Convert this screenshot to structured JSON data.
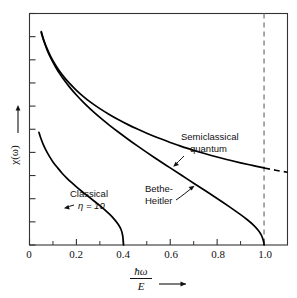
{
  "chart_data": {
    "type": "line",
    "title": "",
    "xlabel": "ħω / E",
    "xlabel_numerator": "ħω",
    "xlabel_denominator": "E",
    "ylabel": "χ(ω)",
    "xlim": [
      0,
      1.1
    ],
    "ylim": [
      0,
      1
    ],
    "grid": false,
    "legend": "annotations-inline",
    "xticks": [
      0,
      0.2,
      0.4,
      0.6,
      0.8,
      1.0
    ],
    "xticklabels": [
      "0",
      "0.2",
      "0.4",
      "0.6",
      "0.8",
      "1.0"
    ],
    "xminorticks": [
      0.1,
      0.3,
      0.5,
      0.7,
      0.9,
      1.1
    ],
    "yticks": [
      0.0,
      0.1,
      0.2,
      0.3,
      0.4,
      0.5,
      0.6,
      0.7,
      0.8,
      0.9,
      1.0
    ],
    "yticklabels": [],
    "series": [
      {
        "name": "Semiclassical quantum",
        "style": "solid-then-dashed",
        "dash_begins_x": 1.0,
        "points": [
          [
            0.05,
            0.922
          ],
          [
            0.06,
            0.888
          ],
          [
            0.075,
            0.848
          ],
          [
            0.09,
            0.815
          ],
          [
            0.11,
            0.779
          ],
          [
            0.13,
            0.748
          ],
          [
            0.15,
            0.722
          ],
          [
            0.17,
            0.699
          ],
          [
            0.2,
            0.668
          ],
          [
            0.23,
            0.641
          ],
          [
            0.26,
            0.617
          ],
          [
            0.3,
            0.589
          ],
          [
            0.34,
            0.564
          ],
          [
            0.38,
            0.541
          ],
          [
            0.42,
            0.52
          ],
          [
            0.46,
            0.501
          ],
          [
            0.5,
            0.483
          ],
          [
            0.55,
            0.462
          ],
          [
            0.6,
            0.443
          ],
          [
            0.65,
            0.425
          ],
          [
            0.7,
            0.409
          ],
          [
            0.75,
            0.394
          ],
          [
            0.8,
            0.38
          ],
          [
            0.85,
            0.367
          ],
          [
            0.9,
            0.355
          ],
          [
            0.95,
            0.344
          ],
          [
            1.0,
            0.333
          ],
          [
            1.05,
            0.323
          ],
          [
            1.1,
            0.314
          ]
        ]
      },
      {
        "name": "Bethe-Heitler",
        "style": "solid",
        "points": [
          [
            0.05,
            0.918
          ],
          [
            0.06,
            0.884
          ],
          [
            0.075,
            0.843
          ],
          [
            0.09,
            0.809
          ],
          [
            0.11,
            0.771
          ],
          [
            0.13,
            0.738
          ],
          [
            0.15,
            0.709
          ],
          [
            0.17,
            0.683
          ],
          [
            0.2,
            0.648
          ],
          [
            0.23,
            0.616
          ],
          [
            0.26,
            0.587
          ],
          [
            0.3,
            0.551
          ],
          [
            0.34,
            0.518
          ],
          [
            0.38,
            0.487
          ],
          [
            0.42,
            0.457
          ],
          [
            0.46,
            0.428
          ],
          [
            0.5,
            0.4
          ],
          [
            0.55,
            0.366
          ],
          [
            0.6,
            0.333
          ],
          [
            0.65,
            0.3
          ],
          [
            0.7,
            0.267
          ],
          [
            0.75,
            0.234
          ],
          [
            0.8,
            0.201
          ],
          [
            0.85,
            0.167
          ],
          [
            0.9,
            0.131
          ],
          [
            0.93,
            0.108
          ],
          [
            0.955,
            0.086
          ],
          [
            0.975,
            0.064
          ],
          [
            0.988,
            0.044
          ],
          [
            0.995,
            0.026
          ],
          [
            0.999,
            0.01
          ],
          [
            1.0,
            0.0
          ]
        ]
      },
      {
        "name": "Classical η = 10",
        "style": "solid",
        "points": [
          [
            0.04,
            0.487
          ],
          [
            0.048,
            0.462
          ],
          [
            0.058,
            0.436
          ],
          [
            0.07,
            0.41
          ],
          [
            0.085,
            0.383
          ],
          [
            0.1,
            0.359
          ],
          [
            0.12,
            0.333
          ],
          [
            0.14,
            0.309
          ],
          [
            0.16,
            0.288
          ],
          [
            0.18,
            0.269
          ],
          [
            0.2,
            0.251
          ],
          [
            0.225,
            0.23
          ],
          [
            0.25,
            0.21
          ],
          [
            0.275,
            0.19
          ],
          [
            0.3,
            0.17
          ],
          [
            0.32,
            0.153
          ],
          [
            0.34,
            0.134
          ],
          [
            0.36,
            0.113
          ],
          [
            0.378,
            0.09
          ],
          [
            0.39,
            0.068
          ],
          [
            0.397,
            0.042
          ],
          [
            0.4,
            0.014
          ],
          [
            0.401,
            0.0
          ]
        ]
      }
    ],
    "annotations": [
      {
        "text_line1": "Semiclassical",
        "text_line2": "quantum",
        "target_x": 0.7,
        "target_y": 0.41
      },
      {
        "text_line1": "Bethe-",
        "text_line2": "Heitler",
        "target_x": 0.745,
        "target_y": 0.238
      },
      {
        "text_line1": "Classical",
        "text_line2": "η = 10",
        "target_x": 0.245,
        "target_y": 0.215
      }
    ],
    "reference_lines": [
      {
        "orientation": "vertical",
        "x": 1.0,
        "style": "dashed",
        "color": "#7a7a7a"
      }
    ]
  },
  "labels": {
    "semiclassical_line1": "Semiclassical",
    "semiclassical_line2": "quantum",
    "bethe_line1": "Bethe-",
    "bethe_line2": "Heitler",
    "classical_line1": "Classical",
    "classical_line2": "η = 10",
    "y_axis": "χ(ω)",
    "x_axis_numerator": "ħω",
    "x_axis_denominator": "E",
    "tick_0": "0",
    "tick_02": "0.2",
    "tick_04": "0.4",
    "tick_06": "0.6",
    "tick_08": "0.8",
    "tick_10": "1.0"
  },
  "colors": {
    "curve": "#000000",
    "frame": "#333333",
    "reference_dash": "#8a8a8a",
    "background": "#ffffff"
  }
}
